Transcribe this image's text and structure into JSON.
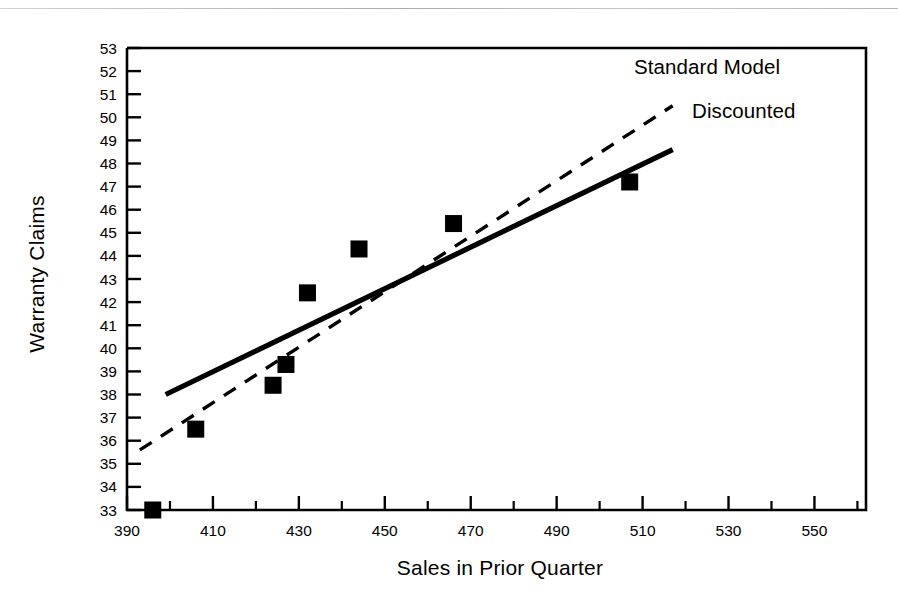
{
  "chart_data": {
    "type": "scatter",
    "title": "",
    "xlabel": "Sales in Prior Quarter",
    "ylabel": "Warranty Claims",
    "xlim": [
      390,
      562
    ],
    "ylim": [
      33,
      53
    ],
    "grid": false,
    "legend_position": "inside-upper-right",
    "x_major_ticks": [
      390,
      410,
      430,
      450,
      470,
      490,
      510,
      530,
      550
    ],
    "x_minor_ticks": [
      400,
      420,
      440,
      460,
      480,
      500,
      520,
      540,
      560
    ],
    "x_tick_labels": [
      "390",
      "410",
      "430",
      "450",
      "470",
      "490",
      "510",
      "530",
      "550"
    ],
    "y_ticks": [
      33,
      34,
      35,
      36,
      37,
      38,
      39,
      40,
      41,
      42,
      43,
      44,
      45,
      46,
      47,
      48,
      49,
      50,
      51,
      52,
      53
    ],
    "y_tick_labels": [
      "33",
      "34",
      "35",
      "36",
      "37",
      "38",
      "39",
      "40",
      "41",
      "42",
      "43",
      "44",
      "45",
      "46",
      "47",
      "48",
      "49",
      "50",
      "51",
      "52",
      "53"
    ],
    "points": [
      {
        "x": 396,
        "y": 33.0
      },
      {
        "x": 406,
        "y": 36.5
      },
      {
        "x": 424,
        "y": 38.4
      },
      {
        "x": 427,
        "y": 39.3
      },
      {
        "x": 432,
        "y": 42.4
      },
      {
        "x": 444,
        "y": 44.3
      },
      {
        "x": 466,
        "y": 45.4
      },
      {
        "x": 507,
        "y": 47.2
      }
    ],
    "marker": "filled-square",
    "marker_color": "#000000",
    "series": [
      {
        "name": "Standard Model",
        "style": "dashed",
        "color": "#000000",
        "x": [
          393,
          517
        ],
        "y": [
          35.6,
          50.5
        ]
      },
      {
        "name": "Discounted",
        "style": "solid",
        "color": "#000000",
        "x": [
          399,
          517
        ],
        "y": [
          38.0,
          48.6
        ]
      }
    ],
    "annotations": [
      {
        "text": "Standard Model",
        "x": 503,
        "y": 51.6
      },
      {
        "text": "Discounted",
        "x": 517,
        "y": 49.7
      }
    ]
  },
  "labels": {
    "y_axis_title": "Warranty Claims",
    "x_axis_title": "Sales in Prior Quarter",
    "series_standard": "Standard Model",
    "series_discounted": "Discounted"
  }
}
